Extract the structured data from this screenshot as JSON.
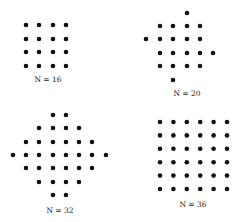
{
  "figure": {
    "dot_color": "#111111",
    "dot_radius": 2.3,
    "panels": [
      {
        "id": "n16",
        "label": "N = 16",
        "label_pos": [
          48,
          82
        ],
        "shape": "square grid 4x4",
        "dots": [
          [
            26,
            25
          ],
          [
            39,
            25
          ],
          [
            53,
            25
          ],
          [
            66,
            25
          ],
          [
            26,
            39
          ],
          [
            39,
            39
          ],
          [
            53,
            39
          ],
          [
            66,
            39
          ],
          [
            26,
            52
          ],
          [
            39,
            52
          ],
          [
            53,
            52
          ],
          [
            66,
            52
          ],
          [
            26,
            66
          ],
          [
            39,
            66
          ],
          [
            53,
            66
          ],
          [
            66,
            66
          ]
        ]
      },
      {
        "id": "n20",
        "label": "N = 20",
        "label_pos": [
          187,
          96
        ],
        "shape": "rotated pinwheel",
        "dots": [
          [
            187,
            13
          ],
          [
            160,
            26
          ],
          [
            173,
            26
          ],
          [
            187,
            26
          ],
          [
            200,
            26
          ],
          [
            146,
            39
          ],
          [
            160,
            39
          ],
          [
            173,
            39
          ],
          [
            187,
            39
          ],
          [
            200,
            39
          ],
          [
            160,
            53
          ],
          [
            173,
            53
          ],
          [
            187,
            53
          ],
          [
            200,
            53
          ],
          [
            213,
            53
          ],
          [
            160,
            66
          ],
          [
            173,
            66
          ],
          [
            187,
            66
          ],
          [
            200,
            66
          ],
          [
            173,
            80
          ]
        ]
      },
      {
        "id": "n32",
        "label": "N = 32",
        "label_pos": [
          60,
          213
        ],
        "shape": "diamond",
        "dots": [
          [
            53,
            115
          ],
          [
            66,
            115
          ],
          [
            39,
            128
          ],
          [
            53,
            128
          ],
          [
            66,
            128
          ],
          [
            79,
            128
          ],
          [
            26,
            142
          ],
          [
            39,
            142
          ],
          [
            53,
            142
          ],
          [
            66,
            142
          ],
          [
            79,
            142
          ],
          [
            92,
            142
          ],
          [
            13,
            155
          ],
          [
            26,
            155
          ],
          [
            39,
            155
          ],
          [
            53,
            155
          ],
          [
            66,
            155
          ],
          [
            79,
            155
          ],
          [
            92,
            155
          ],
          [
            106,
            155
          ],
          [
            26,
            168
          ],
          [
            39,
            168
          ],
          [
            53,
            168
          ],
          [
            66,
            168
          ],
          [
            79,
            168
          ],
          [
            92,
            168
          ],
          [
            39,
            182
          ],
          [
            53,
            182
          ],
          [
            66,
            182
          ],
          [
            79,
            182
          ],
          [
            53,
            195
          ],
          [
            66,
            195
          ]
        ]
      },
      {
        "id": "n36",
        "label": "N = 36",
        "label_pos": [
          193,
          207
        ],
        "shape": "square grid 6x6",
        "grid": {
          "x0": 160,
          "y0": 122,
          "dx": 13.4,
          "dy": 13.4,
          "cols": 6,
          "rows": 6
        }
      }
    ]
  }
}
